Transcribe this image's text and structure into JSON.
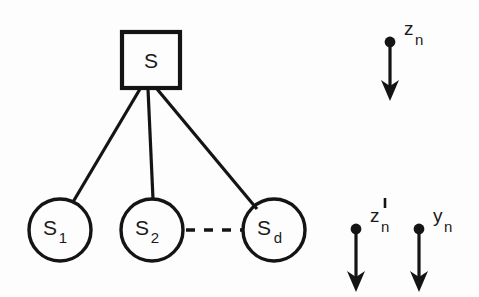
{
  "figure": {
    "background_color": "#fdfdfd",
    "ink_color": "#141414"
  },
  "tree": {
    "root": {
      "label": "S",
      "shape": "square",
      "x": 151,
      "y": 60,
      "width": 58,
      "height": 56
    },
    "leaves": [
      {
        "label_base": "S",
        "label_sub": "1",
        "shape": "circle",
        "cx": 60,
        "cy": 230,
        "r": 31
      },
      {
        "label_base": "S",
        "label_sub": "2",
        "shape": "circle",
        "cx": 152,
        "cy": 230,
        "r": 31
      },
      {
        "label_base": "S",
        "label_sub": "d",
        "shape": "circle",
        "cx": 274,
        "cy": 230,
        "r": 31
      }
    ],
    "edges": [
      {
        "from": "root",
        "to": "S1",
        "x1": 140,
        "y1": 89,
        "x2": 73,
        "y2": 202
      },
      {
        "from": "root",
        "to": "S2",
        "x1": 148,
        "y1": 89,
        "x2": 153,
        "y2": 199
      },
      {
        "from": "root",
        "to": "Sd",
        "x1": 157,
        "y1": 89,
        "x2": 257,
        "y2": 209
      }
    ],
    "ellipsis_link": {
      "style": "dashed",
      "dash_count": 3,
      "x1": 186,
      "x2": 243,
      "y": 230
    }
  },
  "signals": [
    {
      "name": "z-n-arrow",
      "label_base": "z",
      "label_sub": "n",
      "has_prime": false,
      "dot_x": 390,
      "dot_y": 42,
      "tip_y": 101,
      "label_x": 404,
      "label_y": 35
    },
    {
      "name": "z-prime-n-arrow",
      "label_base": "z",
      "label_sub": "n",
      "has_prime": true,
      "dot_x": 356,
      "dot_y": 229,
      "tip_y": 292,
      "label_x": 370,
      "label_y": 222
    },
    {
      "name": "y-n-arrow",
      "label_base": "y",
      "label_sub": "n",
      "has_prime": false,
      "dot_x": 419,
      "dot_y": 229,
      "tip_y": 292,
      "label_x": 433,
      "label_y": 222
    }
  ]
}
